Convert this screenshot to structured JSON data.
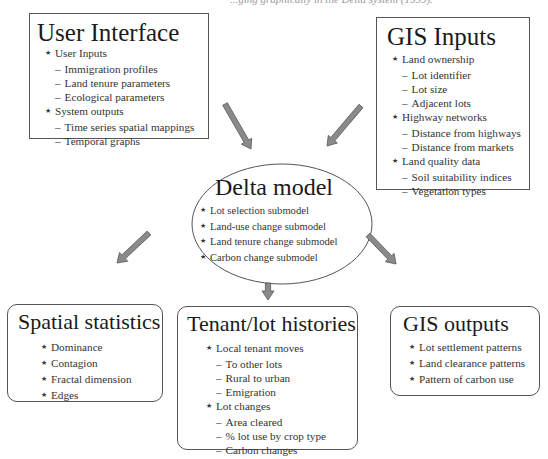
{
  "caption": "...ging graphically in the Delta system (1999).",
  "nodes": {
    "user_interface": {
      "title": "User Interface",
      "items": [
        {
          "level": 1,
          "text": "User Inputs"
        },
        {
          "level": 2,
          "text": "Immigration profiles"
        },
        {
          "level": 2,
          "text": "Land tenure parameters"
        },
        {
          "level": 2,
          "text": "Ecological parameters"
        },
        {
          "level": 1,
          "text": "System outputs"
        },
        {
          "level": 2,
          "text": "Time series spatial mappings"
        },
        {
          "level": 2,
          "text": "Temporal graphs"
        }
      ]
    },
    "gis_inputs": {
      "title": "GIS Inputs",
      "items": [
        {
          "level": 1,
          "text": "Land ownership"
        },
        {
          "level": 2,
          "text": "Lot identifier"
        },
        {
          "level": 2,
          "text": "Lot size"
        },
        {
          "level": 2,
          "text": "Adjacent lots"
        },
        {
          "level": 1,
          "text": "Highway networks"
        },
        {
          "level": 2,
          "text": "Distance from highways"
        },
        {
          "level": 2,
          "text": "Distance from markets"
        },
        {
          "level": 1,
          "text": "Land quality data"
        },
        {
          "level": 2,
          "text": "Soil suitability indices"
        },
        {
          "level": 2,
          "text": "Vegetation types"
        }
      ]
    },
    "delta_model": {
      "title": "Delta model",
      "items": [
        {
          "level": 1,
          "text": "Lot selection submodel"
        },
        {
          "level": 1,
          "text": "Land-use change submodel"
        },
        {
          "level": 1,
          "text": "Land tenure change submodel"
        },
        {
          "level": 1,
          "text": "Carbon change submodel"
        }
      ]
    },
    "spatial_statistics": {
      "title": "Spatial statistics",
      "items": [
        {
          "level": 1,
          "text": "Dominance"
        },
        {
          "level": 1,
          "text": "Contagion"
        },
        {
          "level": 1,
          "text": "Fractal dimension"
        },
        {
          "level": 1,
          "text": "Edges"
        }
      ]
    },
    "tenant_lot_histories": {
      "title": "Tenant/lot histories",
      "items": [
        {
          "level": 1,
          "text": "Local tenant moves"
        },
        {
          "level": 2,
          "text": "To other lots"
        },
        {
          "level": 2,
          "text": "Rural to urban"
        },
        {
          "level": 2,
          "text": "Emigration"
        },
        {
          "level": 1,
          "text": "Lot changes"
        },
        {
          "level": 2,
          "text": "Area cleared"
        },
        {
          "level": 2,
          "text": "% lot use by crop type"
        },
        {
          "level": 2,
          "text": "Carbon changes"
        }
      ]
    },
    "gis_outputs": {
      "title": "GIS outputs",
      "items": [
        {
          "level": 1,
          "text": "Lot settlement patterns"
        },
        {
          "level": 1,
          "text": "Land clearance patterns"
        },
        {
          "level": 1,
          "text": "Pattern of carbon use"
        }
      ]
    }
  },
  "edges": [
    {
      "from": "User Interface",
      "to": "Delta model"
    },
    {
      "from": "GIS Inputs",
      "to": "Delta model"
    },
    {
      "from": "Delta model",
      "to": "Spatial statistics"
    },
    {
      "from": "Delta model",
      "to": "Tenant/lot histories"
    },
    {
      "from": "Delta model",
      "to": "GIS outputs"
    }
  ],
  "colors": {
    "arrow_fill": "#8a8a8a",
    "arrow_stroke": "#555555",
    "border": "#555555"
  }
}
